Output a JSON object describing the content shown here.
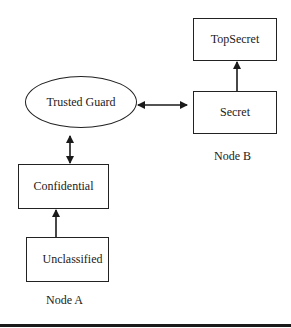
{
  "nodes": {
    "top_secret": "TopSecret",
    "secret": "Secret",
    "trusted_guard": "Trusted Guard",
    "confidential": "Confidential",
    "unclassified": "Unclassified"
  },
  "groups": {
    "node_a": "Node A",
    "node_b": "Node B"
  },
  "edges": [
    {
      "from": "Secret",
      "to": "TopSecret",
      "type": "directed"
    },
    {
      "from": "Trusted Guard",
      "to": "Secret",
      "type": "bidirectional"
    },
    {
      "from": "Trusted Guard",
      "to": "Confidential",
      "type": "bidirectional"
    },
    {
      "from": "Unclassified",
      "to": "Confidential",
      "type": "directed"
    }
  ]
}
